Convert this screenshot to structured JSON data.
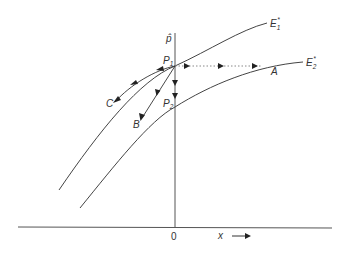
{
  "diagram": {
    "type": "phase-diagram",
    "axes": {
      "vertical_label": "p̂",
      "horizontal_label": "x",
      "origin_label": "0"
    },
    "curves": [
      {
        "name": "E1*",
        "label_main": "E",
        "label_sub": "1",
        "label_sup": "*"
      },
      {
        "name": "E2*",
        "label_main": "E",
        "label_sub": "2",
        "label_sup": "*"
      }
    ],
    "points": [
      {
        "name": "P1",
        "label_main": "P",
        "label_sub": "1"
      },
      {
        "name": "P2",
        "label_main": "P",
        "label_sub": "2"
      }
    ],
    "path_labels": {
      "A": "A",
      "B": "B",
      "C": "C"
    },
    "colors": {
      "line": "#444444",
      "dotted": "#888888",
      "background": "#ffffff"
    }
  }
}
